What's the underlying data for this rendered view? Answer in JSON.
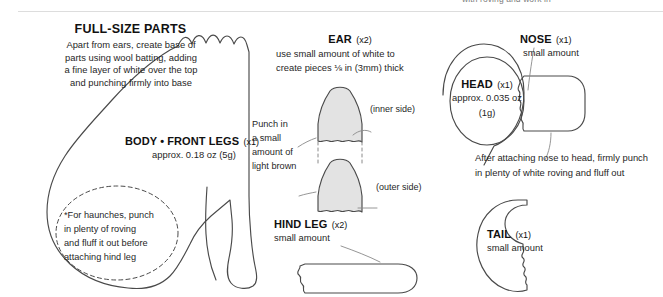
{
  "page": {
    "width": 663,
    "height": 297,
    "background": "#ffffff",
    "ink": "#4a4a4a",
    "text_color": "#1a1a1a",
    "fill_gray": "#e3e3e3",
    "clipped_top_text": "with roving and work in"
  },
  "header": {
    "title": "FULL-SIZE PARTS",
    "intro_lines": [
      "Apart from ears, create base of",
      "parts using wool batting, adding",
      "a fine layer of white over the top",
      "and punching firmly into base"
    ]
  },
  "parts": {
    "body": {
      "label": "BODY • FRONT LEGS",
      "qty": "(x1)",
      "amount": "approx. 0.18 oz (5g)"
    },
    "ear": {
      "label": "EAR",
      "qty": "(x2)",
      "note_lines": [
        "use small amount of white to",
        "create pieces ⅛ in (3mm) thick"
      ],
      "inner_side": "(inner side)",
      "outer_side": "(outer side)"
    },
    "head": {
      "label": "HEAD",
      "qty": "(x1)",
      "amount_line1": "approx. 0.035 oz",
      "amount_line2": "(1g)"
    },
    "nose": {
      "label": "NOSE",
      "qty": "(x1)",
      "amount": "small amount"
    },
    "hind_leg": {
      "label": "HIND LEG",
      "qty": "(x2)",
      "amount": "small amount"
    },
    "tail": {
      "label": "TAIL",
      "qty": "(x1)",
      "amount": "small amount"
    }
  },
  "annotations": {
    "haunches_lines": [
      "*For haunches, punch",
      "in plenty of roving",
      "and fluff it out before",
      "attaching hind leg"
    ],
    "light_brown_lines": [
      "Punch in",
      "a small",
      "amount of",
      "light brown"
    ],
    "nose_attach_lines": [
      "After attaching nose to head, firmly punch",
      "in plenty of white roving and fluff out"
    ]
  }
}
